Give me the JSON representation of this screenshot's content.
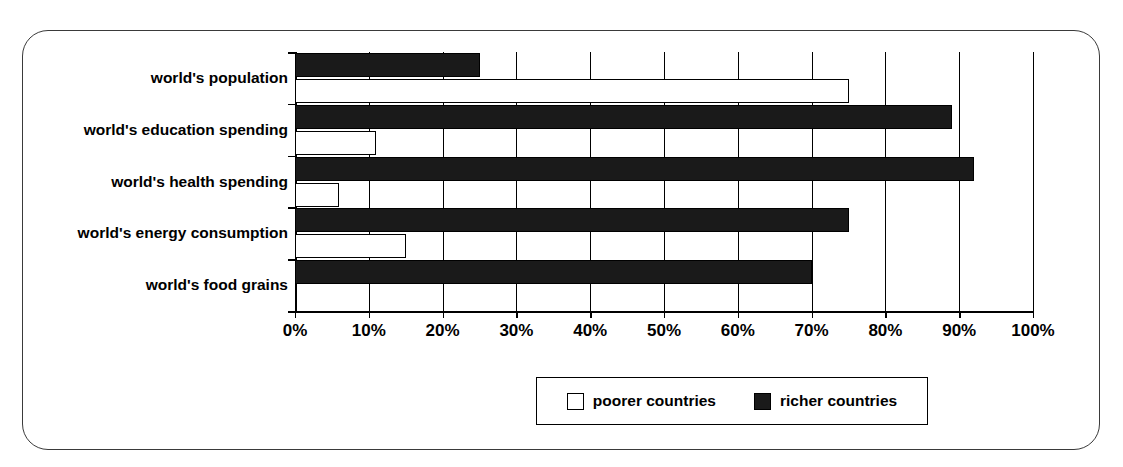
{
  "chart_data": {
    "type": "bar",
    "orientation": "horizontal",
    "title": "",
    "xlabel": "",
    "ylabel": "",
    "xlim": [
      0,
      100
    ],
    "xtick_labels": [
      "0%",
      "10%",
      "20%",
      "30%",
      "40%",
      "50%",
      "60%",
      "70%",
      "80%",
      "90%",
      "100%"
    ],
    "xticks": [
      0,
      10,
      20,
      30,
      40,
      50,
      60,
      70,
      80,
      90,
      100
    ],
    "grid": true,
    "grid_axis": "x",
    "legend_position": "bottom",
    "categories": [
      "world's population",
      "world's education spending",
      "world's health spending",
      "world's energy consumption",
      "world's food grains"
    ],
    "series": [
      {
        "name": "poorer countries",
        "color": "#ffffff",
        "edge_color": "#000000",
        "values": [
          75,
          11,
          6,
          15,
          0
        ]
      },
      {
        "name": "richer countries",
        "color": "#1a1a1a",
        "edge_color": "#000000",
        "values": [
          25,
          89,
          92,
          75,
          70
        ]
      }
    ]
  },
  "legend": {
    "entries": [
      {
        "label": "poorer countries",
        "swatch": "white-square-icon"
      },
      {
        "label": "richer countries",
        "swatch": "black-square-icon"
      }
    ]
  },
  "colors": {
    "rich": "#1a1a1a",
    "poor": "#ffffff",
    "axis": "#000000",
    "frame": "#3a3a3a",
    "background": "#ffffff"
  }
}
